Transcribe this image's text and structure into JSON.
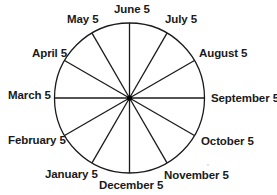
{
  "diagram": {
    "type": "circular-calendar",
    "center": {
      "x": 129.5,
      "y": 98
    },
    "radius": 75,
    "colors": {
      "stroke": "#1a1a1a",
      "text": "#1a1a1a",
      "background": "#ffffff"
    },
    "labels": {
      "march": "March 5",
      "april": "April 5",
      "may": "May 5",
      "june": "June 5",
      "july": "July 5",
      "august": "August 5",
      "september": "September 5",
      "october": "October 5",
      "november": "November 5",
      "december": "December 5",
      "january": "January 5",
      "february": "February 5"
    },
    "spokes": [
      {
        "month": "March 5",
        "angle_deg": 180
      },
      {
        "month": "April 5",
        "angle_deg": 150
      },
      {
        "month": "May 5",
        "angle_deg": 120
      },
      {
        "month": "June 5",
        "angle_deg": 90
      },
      {
        "month": "July 5",
        "angle_deg": 60
      },
      {
        "month": "August 5",
        "angle_deg": 30
      },
      {
        "month": "September 5",
        "angle_deg": 0
      },
      {
        "month": "October 5",
        "angle_deg": -30
      },
      {
        "month": "November 5",
        "angle_deg": -60
      },
      {
        "month": "December 5",
        "angle_deg": -90
      },
      {
        "month": "January 5",
        "angle_deg": -120
      },
      {
        "month": "February 5",
        "angle_deg": -150
      }
    ]
  }
}
